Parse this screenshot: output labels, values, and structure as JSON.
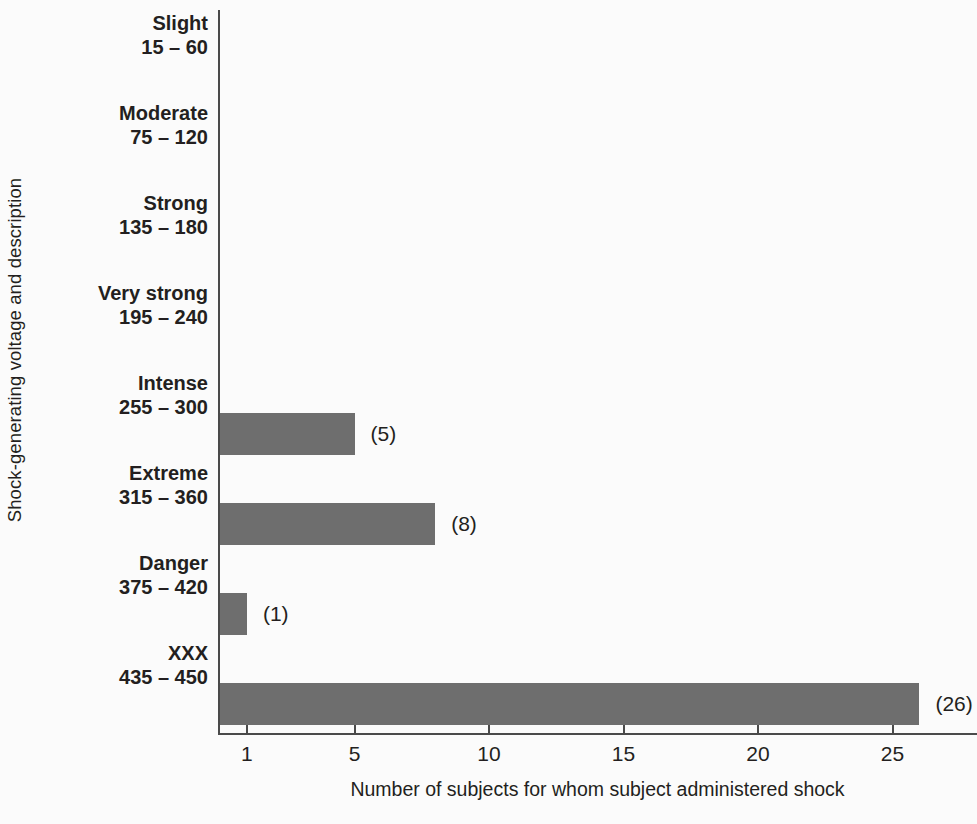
{
  "chart_data": {
    "type": "bar",
    "orientation": "horizontal",
    "title": "",
    "xlabel": "Number of subjects for whom subject administered shock",
    "ylabel": "Shock-generating voltage and description",
    "categories": [
      "Slight",
      "Moderate",
      "Strong",
      "Very strong",
      "Intense",
      "Extreme",
      "Danger",
      "XXX"
    ],
    "category_ranges": [
      "15 – 60",
      "75 – 120",
      "135 – 180",
      "195 – 240",
      "255 – 300",
      "315 – 360",
      "375 – 420",
      "435 – 450"
    ],
    "values": [
      0,
      0,
      0,
      0,
      5,
      8,
      1,
      26
    ],
    "value_labels": [
      "",
      "",
      "",
      "",
      "(5)",
      "(8)",
      "(1)",
      "(26)"
    ],
    "xticks": [
      1,
      5,
      10,
      15,
      20,
      25
    ],
    "xtick_labels": [
      "1",
      "5",
      "10",
      "15",
      "20",
      "25"
    ],
    "xlim": [
      0,
      28
    ],
    "grid": false,
    "legend": null,
    "bar_color": "#6e6e6e",
    "axis_color": "#4a4a4a",
    "text_color": "#231f20",
    "background_color": "#fbfbfb"
  }
}
